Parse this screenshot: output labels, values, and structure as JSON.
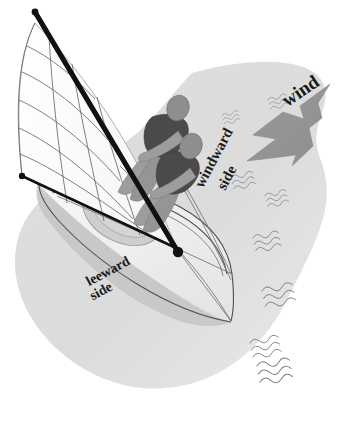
{
  "figure": {
    "background_color": "#ffffff"
  },
  "labels": {
    "wind": "wind",
    "windward_line1": "windward",
    "windward_line2": "side",
    "leeward_line1": "leeward",
    "leeward_line2": "side"
  },
  "colors": {
    "water_fill": "#d9d9d9",
    "water_fill_light": "#e6e6e6",
    "arrow_fill": "#949494",
    "arrow_stroke": "#7a7a7a",
    "sailor_body": "#4a4a4a",
    "sailor_limb": "#9a9a9a",
    "sailor_head": "#8d8d8d",
    "mast_black": "#111111",
    "sail_white": "#fdfdfd",
    "sail_seam": "#555555",
    "hull_deck": "#f2f2f2",
    "hull_shadow": "#bdbdbd",
    "wave_stroke": "#7d7d7d",
    "label_color": "#1a1a1a"
  },
  "elements": {
    "water_body": "water-surface-blob",
    "wind_arrow": "wind-direction-arrow",
    "boat_hull": "dinghy-hull",
    "mainsail": "mainsail",
    "mast": "mast-spar",
    "boom": "boom-spar",
    "sailor_helm": "sailor-helmsman",
    "sailor_crew": "sailor-crew",
    "waves": "water-ripple-marks"
  },
  "geometry": {
    "wind_label_rotation_deg": -34,
    "windward_label_rotation_deg": -62,
    "leeward_label_rotation_deg": -28,
    "arrow_direction": "down-left",
    "wave_count": 8
  },
  "waves": [
    {
      "name": "wave-mark-1",
      "x": 268,
      "y": 100,
      "scale": 0.52,
      "rot": -16
    },
    {
      "name": "wave-mark-2",
      "x": 222,
      "y": 116,
      "scale": 0.46,
      "rot": -16
    },
    {
      "name": "wave-mark-3",
      "x": 231,
      "y": 178,
      "scale": 0.62,
      "rot": -14
    },
    {
      "name": "wave-mark-4",
      "x": 265,
      "y": 196,
      "scale": 0.6,
      "rot": -14
    },
    {
      "name": "wave-mark-5",
      "x": 253,
      "y": 238,
      "scale": 0.72,
      "rot": -12
    },
    {
      "name": "wave-mark-6",
      "x": 262,
      "y": 291,
      "scale": 0.86,
      "rot": -12
    },
    {
      "name": "wave-mark-7",
      "x": 250,
      "y": 343,
      "scale": 0.8,
      "rot": -12
    },
    {
      "name": "wave-mark-8",
      "x": 257,
      "y": 366,
      "scale": 0.92,
      "rot": -10
    }
  ]
}
